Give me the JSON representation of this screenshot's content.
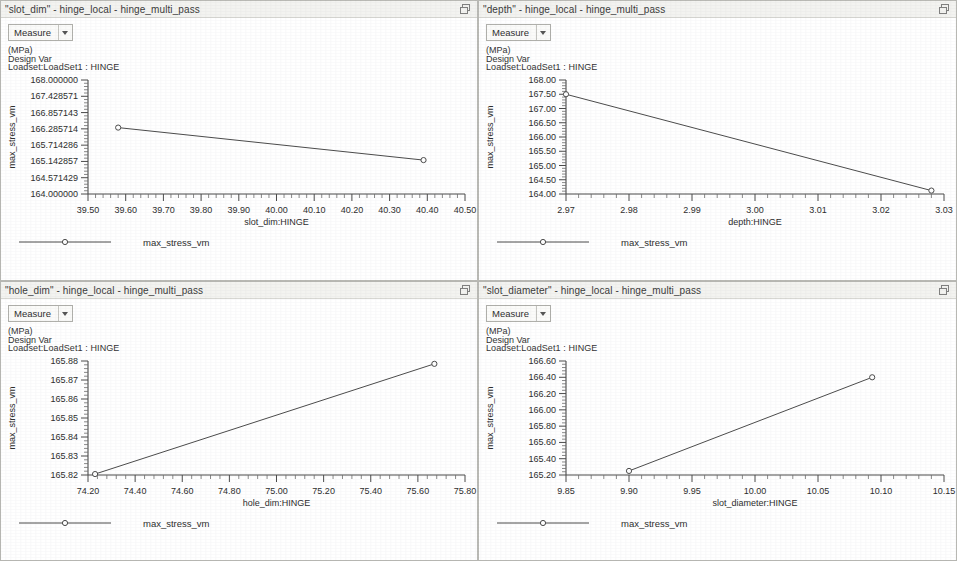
{
  "window": {
    "restore_icon": "restore-window-icon"
  },
  "panels": [
    {
      "title": "\"slot_dim\" - hinge_local - hinge_multi_pass",
      "measure_label": "Measure",
      "meta_units": "(MPa)",
      "meta_type": "Design Var",
      "meta_loadset": "Loadset:LoadSet1 :  HINGE",
      "legend_label": "max_stress_vm"
    },
    {
      "title": "\"depth\" - hinge_local - hinge_multi_pass",
      "measure_label": "Measure",
      "meta_units": "(MPa)",
      "meta_type": "Design Var",
      "meta_loadset": "Loadset:LoadSet1 :  HINGE",
      "legend_label": "max_stress_vm"
    },
    {
      "title": "\"hole_dim\" - hinge_local - hinge_multi_pass",
      "measure_label": "Measure",
      "meta_units": "(MPa)",
      "meta_type": "Design Var",
      "meta_loadset": "Loadset:LoadSet1 :  HINGE",
      "legend_label": "max_stress_vm"
    },
    {
      "title": "\"slot_diameter\" - hinge_local - hinge_multi_pass",
      "measure_label": "Measure",
      "meta_units": "(MPa)",
      "meta_type": "Design Var",
      "meta_loadset": "Loadset:LoadSet1 :  HINGE",
      "legend_label": "max_stress_vm"
    }
  ],
  "chart_data": [
    {
      "type": "line",
      "title": "\"slot_dim\" - hinge_local - hinge_multi_pass",
      "xlabel": "slot_dim:HINGE",
      "ylabel": "max_stress_vm",
      "units": "(MPa)",
      "legend": [
        "max_stress_vm"
      ],
      "grid": false,
      "xlim": [
        39.5,
        40.5
      ],
      "ylim": [
        164.0,
        168.0
      ],
      "xticks": [
        "39.50",
        "39.60",
        "39.70",
        "39.80",
        "39.90",
        "40.00",
        "40.10",
        "40.20",
        "40.30",
        "40.40",
        "40.50"
      ],
      "xtick_values": [
        39.5,
        39.6,
        39.7,
        39.8,
        39.9,
        40.0,
        40.1,
        40.2,
        40.3,
        40.4,
        40.5
      ],
      "yticks": [
        "168.000000",
        "167.428571",
        "166.857143",
        "166.285714",
        "165.714286",
        "165.142857",
        "164.571429",
        "164.000000"
      ],
      "ytick_values": [
        168.0,
        167.428571,
        166.857143,
        166.285714,
        165.714286,
        165.142857,
        164.571429,
        164.0
      ],
      "series": [
        {
          "name": "max_stress_vm",
          "x": [
            39.58,
            40.39
          ],
          "y": [
            166.33,
            165.19
          ]
        }
      ]
    },
    {
      "type": "line",
      "title": "\"depth\" - hinge_local - hinge_multi_pass",
      "xlabel": "depth:HINGE",
      "ylabel": "max_stress_vm",
      "units": "(MPa)",
      "legend": [
        "max_stress_vm"
      ],
      "grid": false,
      "xlim": [
        2.97,
        3.03
      ],
      "ylim": [
        164.0,
        168.0
      ],
      "xticks": [
        "2.97",
        "2.98",
        "2.99",
        "3.00",
        "3.01",
        "3.02",
        "3.03"
      ],
      "xtick_values": [
        2.97,
        2.98,
        2.99,
        3.0,
        3.01,
        3.02,
        3.03
      ],
      "yticks": [
        "168.00",
        "167.50",
        "167.00",
        "166.50",
        "166.00",
        "165.50",
        "165.00",
        "164.50",
        "164.00"
      ],
      "ytick_values": [
        168.0,
        167.5,
        167.0,
        166.5,
        166.0,
        165.5,
        165.0,
        164.5,
        164.0
      ],
      "series": [
        {
          "name": "max_stress_vm",
          "x": [
            2.97,
            3.028
          ],
          "y": [
            167.5,
            164.12
          ]
        }
      ]
    },
    {
      "type": "line",
      "title": "\"hole_dim\" - hinge_local - hinge_multi_pass",
      "xlabel": "hole_dim:HINGE",
      "ylabel": "max_stress_vm",
      "units": "(MPa)",
      "legend": [
        "max_stress_vm"
      ],
      "grid": false,
      "xlim": [
        74.2,
        75.8
      ],
      "ylim": [
        165.82,
        165.88
      ],
      "xticks": [
        "74.20",
        "74.40",
        "74.60",
        "74.80",
        "75.00",
        "75.20",
        "75.40",
        "75.60",
        "75.80"
      ],
      "xtick_values": [
        74.2,
        74.4,
        74.6,
        74.8,
        75.0,
        75.2,
        75.4,
        75.6,
        75.8
      ],
      "yticks": [
        "165.88",
        "165.87",
        "165.86",
        "165.85",
        "165.84",
        "165.83",
        "165.82"
      ],
      "ytick_values": [
        165.88,
        165.87,
        165.86,
        165.85,
        165.84,
        165.83,
        165.82
      ],
      "series": [
        {
          "name": "max_stress_vm",
          "x": [
            74.23,
            75.67
          ],
          "y": [
            165.8205,
            165.8785
          ]
        }
      ]
    },
    {
      "type": "line",
      "title": "\"slot_diameter\" - hinge_local - hinge_multi_pass",
      "xlabel": "slot_diameter:HINGE",
      "ylabel": "max_stress_vm",
      "units": "(MPa)",
      "legend": [
        "max_stress_vm"
      ],
      "grid": false,
      "xlim": [
        9.85,
        10.15
      ],
      "ylim": [
        165.2,
        166.6
      ],
      "xticks": [
        "9.85",
        "9.90",
        "9.95",
        "10.00",
        "10.05",
        "10.10",
        "10.15"
      ],
      "xtick_values": [
        9.85,
        9.9,
        9.95,
        10.0,
        10.05,
        10.1,
        10.15
      ],
      "yticks": [
        "166.60",
        "166.40",
        "166.20",
        "166.00",
        "165.80",
        "165.60",
        "165.40",
        "165.20"
      ],
      "ytick_values": [
        166.6,
        166.4,
        166.2,
        166.0,
        165.8,
        165.6,
        165.4,
        165.2
      ],
      "series": [
        {
          "name": "max_stress_vm",
          "x": [
            9.9,
            10.093
          ],
          "y": [
            165.25,
            166.4
          ]
        }
      ]
    }
  ]
}
